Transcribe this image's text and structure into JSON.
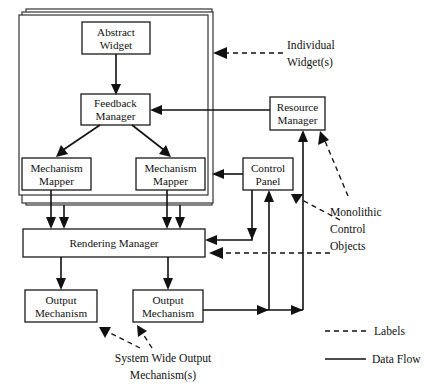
{
  "figure": {
    "boxes": {
      "abstract_widget": "Abstract\nWidget",
      "abstract_widget_line1": "Abstract",
      "abstract_widget_line2": "Widget",
      "feedback_manager_line1": "Feedback",
      "feedback_manager_line2": "Manager",
      "mechanism_mapper_left_line1": "Mechanism",
      "mechanism_mapper_left_line2": "Mapper",
      "mechanism_mapper_right_line1": "Mechanism",
      "mechanism_mapper_right_line2": "Mapper",
      "resource_manager_line1": "Resource",
      "resource_manager_line2": "Manager",
      "control_panel_line1": "Control",
      "control_panel_line2": "Panel",
      "rendering_manager": "Rendering Manager",
      "output_mechanism_left_line1": "Output",
      "output_mechanism_left_line2": "Mechanism",
      "output_mechanism_right_line1": "Output",
      "output_mechanism_right_line2": "Mechanism"
    },
    "annotations": {
      "individual_widgets_line1": "Individual",
      "individual_widgets_line2": "Widget(s)",
      "monolithic_line1": "Monolithic",
      "monolithic_line2": "Control",
      "monolithic_line3": "Objects",
      "system_wide_line1": "System Wide Output",
      "system_wide_line2": "Mechanism(s)"
    },
    "legend": {
      "labels_entry": "Labels",
      "dataflow_entry": "Data Flow"
    },
    "colors": {
      "stroke": "#111111",
      "box_fill": "#ffffff",
      "frame_stroke": "#333333",
      "background": "#ffffff"
    }
  }
}
